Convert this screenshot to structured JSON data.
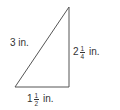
{
  "figure": {
    "type": "right-triangle",
    "stroke_color": "#555555",
    "vertices": [
      [
        15,
        87
      ],
      [
        69,
        7
      ],
      [
        69,
        87
      ]
    ],
    "labels": {
      "hypotenuse": {
        "text": "3 in."
      },
      "vertical_leg": {
        "whole": "2",
        "num": "1",
        "den": "4",
        "unit": "in."
      },
      "horizontal_leg": {
        "whole": "1",
        "num": "1",
        "den": "2",
        "unit": "in."
      }
    }
  }
}
